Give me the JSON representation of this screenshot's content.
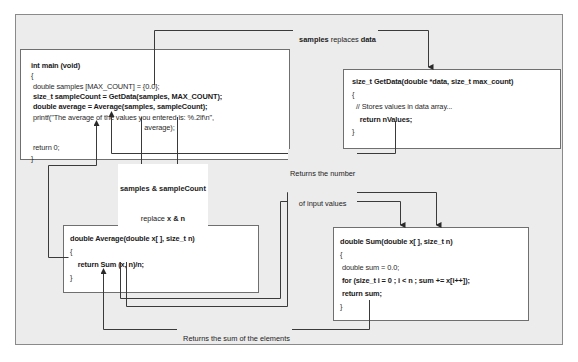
{
  "main_box": {
    "lines": [
      {
        "text": "int main (void)",
        "bold": true
      },
      {
        "text": "{",
        "bold": false
      },
      {
        "text": " double samples [MAX_COUNT] = {0.0};",
        "bold": false
      },
      {
        "text": " size_t sampleCount = GetData(samples, MAX_COUNT);",
        "bold": true
      },
      {
        "text": " double average = Average(samples, sampleCount);",
        "bold": true
      },
      {
        "text": " printf(\"The average of the values you entered is: %.2lf\\n\",",
        "bold": false
      },
      {
        "text": "                                                          average);",
        "bold": false
      },
      {
        "text": "",
        "bold": false
      },
      {
        "text": " return 0;",
        "bold": false
      },
      {
        "text": "}",
        "bold": false
      }
    ]
  },
  "getdata_box": {
    "lines": [
      {
        "text": "size_t GetData(double *data, size_t max_count)",
        "bold": true
      },
      {
        "text": "{",
        "bold": false
      },
      {
        "text": "  // Stores values in data array...",
        "bold": false
      },
      {
        "text": "    return nValues;",
        "bold": true
      },
      {
        "text": "}",
        "bold": false
      }
    ]
  },
  "average_box": {
    "lines": [
      {
        "text": "double Average(double x[ ], size_t n)",
        "bold": true
      },
      {
        "text": "{",
        "bold": false
      },
      {
        "text": "    return Sum (x, n)/n;",
        "bold": true
      },
      {
        "text": "}",
        "bold": false
      }
    ]
  },
  "sum_box": {
    "lines": [
      {
        "text": "double Sum(double x[ ], size_t n)",
        "bold": true
      },
      {
        "text": "{",
        "bold": false
      },
      {
        "text": " double sum = 0.0;",
        "bold": false
      },
      {
        "text": " for (size_t i = 0 ; i < n ; sum += x[i++]);",
        "bold": true
      },
      {
        "text": " return sum;",
        "bold": true
      },
      {
        "text": "}",
        "bold": false
      }
    ]
  },
  "annotations": {
    "samples_replaces_data": {
      "bold1": "samples",
      "normal": " replaces ",
      "bold2": "data"
    },
    "returns_number_line1": "Returns the number",
    "returns_number_line2": "of input values",
    "samples_replace_xn_line1": "samples & sampleCount",
    "samples_replace_xn_line2_normal": "replace ",
    "samples_replace_xn_line2_bold": "x & n",
    "returns_sum": "Returns the sum of the elements"
  },
  "colors": {
    "frame_bg": "#ececec",
    "box_bg": "#ffffff",
    "wire": "#3a3a3a"
  }
}
